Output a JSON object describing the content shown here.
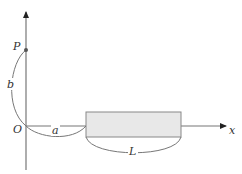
{
  "diagram": {
    "type": "geometry/physics figure",
    "axes": {
      "x_label": "x",
      "y_label": "",
      "origin_label": "O"
    },
    "point": {
      "label": "P"
    },
    "dimensions": {
      "b": "b",
      "a": "a",
      "L": "L"
    },
    "colors": {
      "stroke": "#666666",
      "rod_fill": "#e8e8e8",
      "text": "#333333"
    }
  }
}
